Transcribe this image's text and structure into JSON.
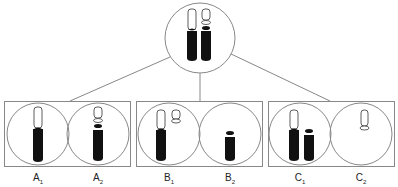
{
  "diagram": {
    "colors": {
      "stroke": "#888888",
      "chromosome_fill": "#111111",
      "background": "#ffffff"
    },
    "parent_cell": {
      "name": "parent",
      "chromosomes": [
        "intact",
        "with-segment"
      ]
    },
    "groups": [
      {
        "id": "A",
        "cells": [
          {
            "letter": "A",
            "sub": "1",
            "content": "one long chromosome (white top, black bottom)"
          },
          {
            "letter": "A",
            "sub": "2",
            "content": "chromosome with segment"
          }
        ]
      },
      {
        "id": "B",
        "cells": [
          {
            "letter": "B",
            "sub": "1",
            "content": "long chromosome plus detached white fragment"
          },
          {
            "letter": "B",
            "sub": "2",
            "content": "short black chromosome without top"
          }
        ]
      },
      {
        "id": "C",
        "cells": [
          {
            "letter": "C",
            "sub": "1",
            "content": "long chromosome plus short black chromosome"
          },
          {
            "letter": "C",
            "sub": "2",
            "content": "white fragment only"
          }
        ]
      }
    ]
  },
  "labels": {
    "a1": {
      "letter": "A",
      "sub": "1"
    },
    "a2": {
      "letter": "A",
      "sub": "2"
    },
    "b1": {
      "letter": "B",
      "sub": "1"
    },
    "b2": {
      "letter": "B",
      "sub": "2"
    },
    "c1": {
      "letter": "C",
      "sub": "1"
    },
    "c2": {
      "letter": "C",
      "sub": "2"
    }
  }
}
